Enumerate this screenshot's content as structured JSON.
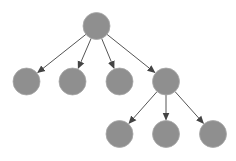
{
  "diagram": {
    "type": "tree",
    "node_color": "#8f8f8f",
    "node_stroke": "#a8a8a8",
    "edge_color": "#555555",
    "node_radius": 13.5,
    "nodes": [
      {
        "id": "root",
        "x": 96.5,
        "y": 26
      },
      {
        "id": "c1",
        "x": 26.5,
        "y": 81.5
      },
      {
        "id": "c2",
        "x": 72.5,
        "y": 81.5
      },
      {
        "id": "c3",
        "x": 119.5,
        "y": 81.5
      },
      {
        "id": "c4",
        "x": 166,
        "y": 81.5
      },
      {
        "id": "g1",
        "x": 119.5,
        "y": 134
      },
      {
        "id": "g2",
        "x": 166,
        "y": 134
      },
      {
        "id": "g3",
        "x": 213,
        "y": 134
      }
    ],
    "edges": [
      {
        "from": "root",
        "to": "c1"
      },
      {
        "from": "root",
        "to": "c2"
      },
      {
        "from": "root",
        "to": "c3"
      },
      {
        "from": "root",
        "to": "c4"
      },
      {
        "from": "c4",
        "to": "g1"
      },
      {
        "from": "c4",
        "to": "g2"
      },
      {
        "from": "c4",
        "to": "g3"
      }
    ]
  }
}
